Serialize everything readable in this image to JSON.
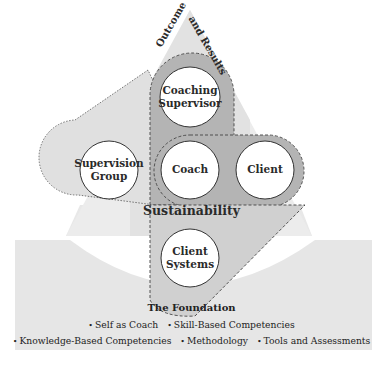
{
  "diagram": {
    "apex_labels": {
      "left": "Outcome",
      "right": "and Results"
    },
    "nodes": [
      {
        "id": "coaching-supervisor",
        "label_line1": "Coaching",
        "label_line2": "Supervisor"
      },
      {
        "id": "supervision-group",
        "label_line1": "Supervision",
        "label_line2": "Group"
      },
      {
        "id": "coach",
        "label_line1": "Coach",
        "label_line2": ""
      },
      {
        "id": "client",
        "label_line1": "Client",
        "label_line2": ""
      },
      {
        "id": "client-systems",
        "label_line1": "Client",
        "label_line2": "Systems"
      }
    ],
    "sustainability_label": "Sustainability",
    "foundation": {
      "title": "The Foundation",
      "line1": [
        "Self as Coach",
        "Skill-Based Competencies"
      ],
      "line2": [
        "Knowledge-Based Competencies",
        "Methodology",
        "Tools and Assessments"
      ],
      "bullet": "•"
    },
    "colors": {
      "pyramid_light": "#ececec",
      "pyramid_mid": "#e0e0e0",
      "band_dark": "#b4b4b4",
      "band_light": "#d6d6d6",
      "foundation_band": "#e6e6e6",
      "circle_fill": "#ffffff",
      "outline": "#444444"
    }
  }
}
